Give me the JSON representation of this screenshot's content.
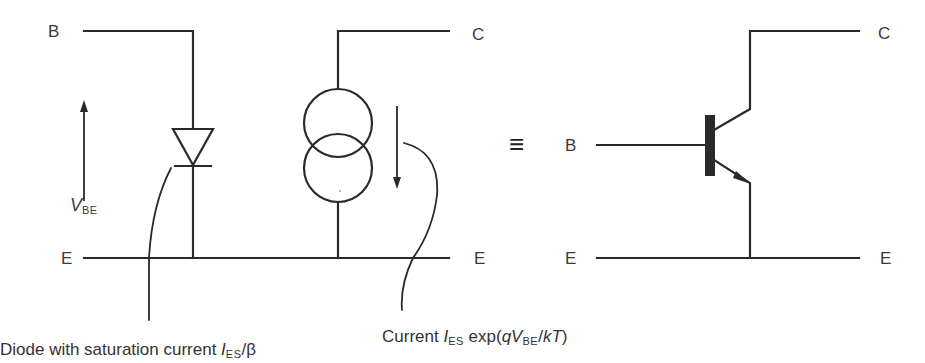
{
  "diagram": {
    "left_circuit": {
      "terminals": {
        "base": "B",
        "collector": "C",
        "emitter_left": "E",
        "emitter_right": "E"
      },
      "voltage_label": {
        "symbol": "V",
        "subscript": "BE"
      },
      "diode_caption": {
        "text": "Diode with saturation current ",
        "symbol": "I",
        "subscript": "ES",
        "suffix": "/β"
      },
      "current_caption": {
        "text": "Current ",
        "symbol": "I",
        "subscript": "ES",
        "mid": " exp(",
        "q": "q",
        "v": "V",
        "v_subscript": "BE",
        "slash": "/",
        "kT": "kT",
        "close": ")"
      }
    },
    "equivalence_symbol": "≡",
    "right_circuit": {
      "terminals": {
        "base": "B",
        "collector": "C",
        "emitter_left": "E",
        "emitter_right": "E"
      },
      "component": "npn-transistor"
    },
    "colors": {
      "line": "#2a2a2a",
      "text": "#3a3a3a",
      "background": "#ffffff"
    }
  }
}
